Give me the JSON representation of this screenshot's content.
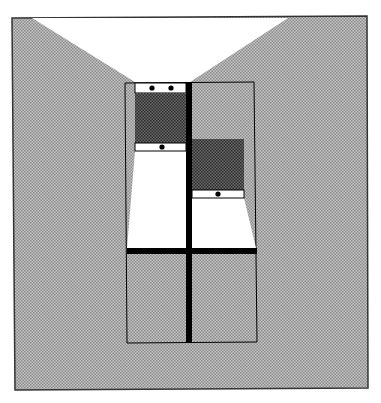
{
  "colors": {
    "wall_fill": "#b8b8b8",
    "wall_dot": "#8a8a8a",
    "sash_fill": "#505050",
    "sash_dot": "#2a2a2a",
    "light": "#ffffff",
    "frame": "#000000"
  },
  "window": {
    "panes": 4,
    "left_sash": {
      "handles_top": 2,
      "handles_bottom": 1
    },
    "right_sash": {
      "handles_bottom": 1
    }
  }
}
